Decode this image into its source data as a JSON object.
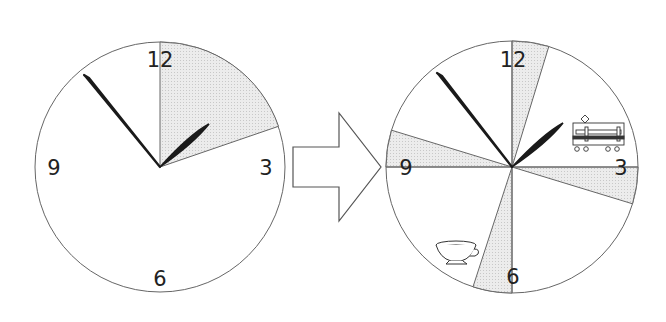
{
  "diagram": {
    "left_clock": {
      "numerals": [
        "12",
        "3",
        "6",
        "9"
      ],
      "shaded_sector_deg": [
        0,
        71
      ],
      "hour_hand_deg": 49,
      "minute_hand_deg": 320
    },
    "arrow": {
      "direction": "right"
    },
    "right_clock": {
      "numerals": [
        "12",
        "3",
        "6",
        "9"
      ],
      "shaded_sectors_deg": [
        [
          0,
          17
        ],
        [
          90,
          107
        ],
        [
          180,
          198
        ],
        [
          270,
          287
        ]
      ],
      "hour_hand_deg": 49,
      "minute_hand_deg": 321,
      "icons": [
        "train-icon",
        "teacup-icon"
      ]
    },
    "colors": {
      "shade": "#e4e4e4",
      "line": "#555555",
      "hand": "#1a1a1a"
    }
  }
}
